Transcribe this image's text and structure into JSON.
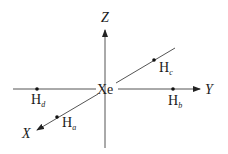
{
  "diagram": {
    "center_atom": "Xe",
    "axes": {
      "x": "X",
      "y": "Y",
      "z": "Z"
    },
    "ligands": [
      {
        "id": "a",
        "symbol": "H",
        "subscript": "a",
        "axis": "X"
      },
      {
        "id": "b",
        "symbol": "H",
        "subscript": "b",
        "axis": "Y"
      },
      {
        "id": "c",
        "symbol": "H",
        "subscript": "c",
        "axis": "-X"
      },
      {
        "id": "d",
        "symbol": "H",
        "subscript": "d",
        "axis": "-Y"
      }
    ],
    "colors": {
      "line": "#555555",
      "text": "#1a1a1a"
    }
  }
}
